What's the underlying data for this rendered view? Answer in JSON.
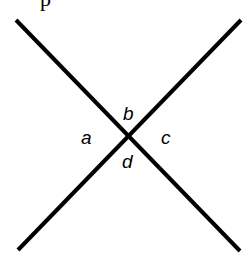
{
  "diagram": {
    "type": "intersecting-lines",
    "lines": [
      {
        "x1": 16,
        "y1": 20,
        "x2": 240,
        "y2": 251
      },
      {
        "x1": 241,
        "y1": 20,
        "x2": 18,
        "y2": 250
      }
    ],
    "line_color": "#000000",
    "angle_labels": {
      "a": "a",
      "b": "b",
      "c": "c",
      "d": "d"
    },
    "top_fragment": "p"
  }
}
